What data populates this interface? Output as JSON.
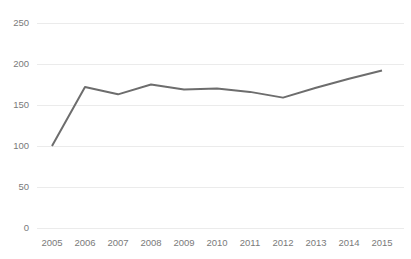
{
  "chart_data": {
    "type": "line",
    "title": "",
    "subtitle": "",
    "xlabel": "",
    "ylabel": "",
    "categories": [
      "2005",
      "2006",
      "2007",
      "2008",
      "2009",
      "2010",
      "2011",
      "2012",
      "2013",
      "2014",
      "2015"
    ],
    "series": [
      {
        "name": "Index",
        "values": [
          100,
          172,
          163,
          175,
          169,
          170,
          166,
          159,
          171,
          182,
          192
        ],
        "color": "#6d6d6d"
      }
    ],
    "ylim": [
      0,
      250
    ],
    "y_ticks": [
      0,
      50,
      100,
      150,
      200,
      250
    ],
    "y_tick_labels": [
      "0",
      "50",
      "100",
      "150",
      "200",
      "250"
    ],
    "x_tick_labels": [
      "2005",
      "2006",
      "2007",
      "2008",
      "2009",
      "2010",
      "2011",
      "2012",
      "2013",
      "2014",
      "2015"
    ],
    "grid": true,
    "grid_axis": "y",
    "grid_color": "#ebebeb",
    "legend": false,
    "legend_position": "none",
    "markers": false,
    "background_color": "#ffffff",
    "tick_label_color": "#7a7a7a",
    "annotations": []
  }
}
